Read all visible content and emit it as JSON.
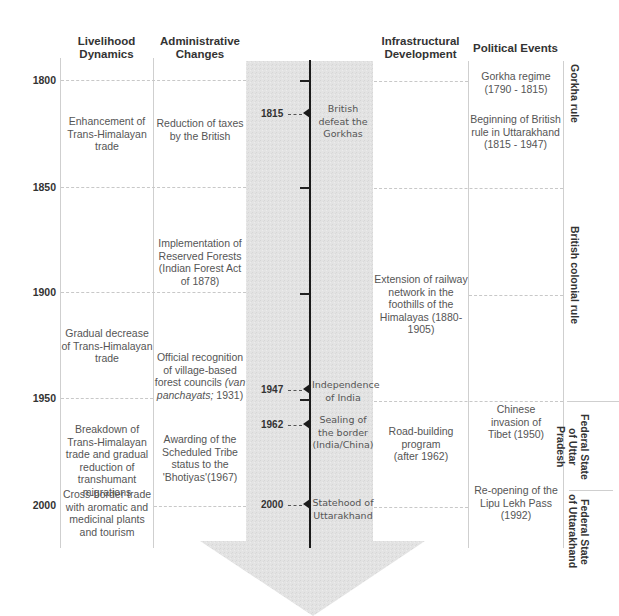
{
  "headers": {
    "livelihood": "Livelihood Dynamics",
    "administrative": "Administrative Changes",
    "infrastructural": "Infrastructural Development",
    "political": "Political Events"
  },
  "years": [
    "1800",
    "1850",
    "1900",
    "1950",
    "2000"
  ],
  "livelihood": [
    {
      "text": "Enhancement of Trans-Himalayan trade"
    },
    {
      "text": "Gradual decrease of Trans-Himalayan trade"
    },
    {
      "text": "Breakdown of Trans-Himalayan trade and gradual reduction of transhumant migrations"
    },
    {
      "text": "Cross-border trade with aromatic and medicinal plants and tourism"
    }
  ],
  "administrative": [
    {
      "text": "Reduction of taxes by the British"
    },
    {
      "text": "Implementation of Reserved Forests (Indian Forest Act of 1878)"
    },
    {
      "text_a": "Official recognition of village-based forest councils",
      "text_italic": "(van panchayats;",
      "text_b": "1931)"
    },
    {
      "text": "Awarding of the Scheduled Tribe status to the 'Bhotiyas'(1967)"
    }
  ],
  "timeline_events": [
    {
      "year": "1815",
      "label": "British defeat the Gorkhas"
    },
    {
      "year": "1947",
      "label": "Independence of India"
    },
    {
      "year": "1962",
      "label": "Sealing of the border (India/China)"
    },
    {
      "year": "2000",
      "label": "Statehood of Uttarakhand"
    }
  ],
  "infrastructural": [
    {
      "text": "Extension of railway network in the foothills of the Himalayas (1880-1905)"
    },
    {
      "text": "Road-building program (after 1962)"
    }
  ],
  "political": [
    {
      "text": "Gorkha regime (1790 - 1815)"
    },
    {
      "text": "Beginning of British rule in Uttarakhand (1815 - 1947)"
    },
    {
      "text": "Chinese invasion of Tibet (1950)"
    },
    {
      "text": "Re-opening of the Lipu Lekh Pass (1992)"
    }
  ],
  "periods": [
    {
      "label": "Gorkha rule"
    },
    {
      "label": "British colonial rule"
    },
    {
      "label": "Federal State of Uttar Pradesh"
    },
    {
      "label": "Federal State of Uttarakhand"
    }
  ],
  "colors": {
    "band": "#e4e4e4",
    "timeline": "#1a1a1a",
    "divider": "#cfcfcf",
    "text": "#555555",
    "heading": "#333333"
  }
}
